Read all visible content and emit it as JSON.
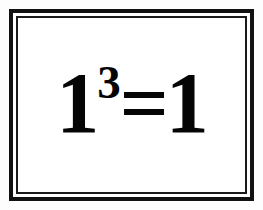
{
  "image": {
    "kind": "framed-equation-card",
    "background_color": "#fdfdfd",
    "card_color": "#ffffff",
    "ink_color": "#050505"
  },
  "frame": {
    "outer_rule_color": "#111111",
    "gutter_color": "#ffffff",
    "inner_rule_color": "#1a1a1a",
    "style": "double-rule-rectangle"
  },
  "equation": {
    "full_text": "1³=1",
    "plain_text": "1^3=1",
    "base": "1",
    "exponent": "3",
    "operator": "=",
    "result": "1",
    "meaning": "one cubed equals one"
  }
}
